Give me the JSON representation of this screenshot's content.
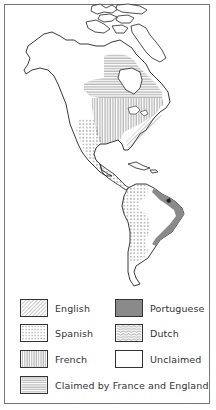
{
  "map": {
    "title": "",
    "regions": [
      {
        "name": "North America",
        "claims": [
          "Claimed by France and England",
          "French",
          "English",
          "Spanish"
        ]
      },
      {
        "name": "Central America & Caribbean",
        "claims": [
          "Spanish"
        ]
      },
      {
        "name": "South America",
        "claims": [
          "Spanish",
          "Portuguese",
          "Unclaimed"
        ]
      }
    ]
  },
  "legend": {
    "items": [
      {
        "key": "english",
        "label": "English",
        "pattern": "diagonal-hatch"
      },
      {
        "key": "portuguese",
        "label": "Portuguese",
        "pattern": "solid-gray",
        "color": "#8a8a8a"
      },
      {
        "key": "spanish",
        "label": "Spanish",
        "pattern": "dots"
      },
      {
        "key": "dutch",
        "label": "Dutch",
        "pattern": "wavy"
      },
      {
        "key": "french",
        "label": "French",
        "pattern": "vertical-lines"
      },
      {
        "key": "unclaimed",
        "label": "Unclaimed",
        "pattern": "blank",
        "color": "#ffffff"
      },
      {
        "key": "france_england",
        "label": "Claimed by France and England",
        "pattern": "horizontal-lines"
      }
    ]
  },
  "colors": {
    "outline": "#222222",
    "hatch": "#555555",
    "portuguese": "#8a8a8a",
    "frame": "#777777"
  }
}
